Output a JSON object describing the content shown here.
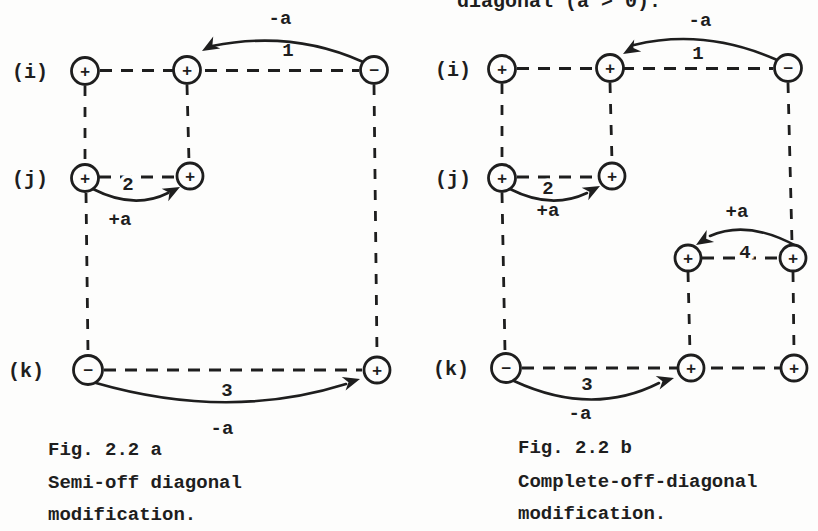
{
  "top_text": "diagonal (a > 0).",
  "colors": {
    "paper": "#fdfdfc",
    "ink": "#1e1e1e"
  },
  "fig_a": {
    "row_i": "(i)",
    "row_j": "(j)",
    "row_k": "(k)",
    "signs": {
      "i1": "+",
      "i2": "+",
      "i3": "−",
      "j1": "+",
      "j2": "+",
      "k1": "−",
      "k2": "+"
    },
    "arc1_num": "1",
    "arc1_amt": "-a",
    "arc2_num": "2",
    "arc2_amt": "+a",
    "arc3_num": "3",
    "arc3_amt": "-a",
    "caption": [
      "Fig. 2.2 a",
      "Semi-off diagonal",
      "modification."
    ]
  },
  "fig_b": {
    "row_i": "(i)",
    "row_j": "(j)",
    "row_k": "(k)",
    "signs": {
      "i1": "+",
      "i2": "+",
      "i3": "−",
      "j1": "+",
      "j2": "+",
      "m1": "+",
      "m2": "+",
      "k1": "−",
      "k2": "+",
      "k3": "+"
    },
    "arc1_num": "1",
    "arc1_amt": "-a",
    "arc2_num": "2",
    "arc2_amt": "+a",
    "arc4_num": "4",
    "arc4_amt": "+a",
    "arc3_num": "3",
    "arc3_amt": "-a",
    "caption": [
      "Fig. 2.2 b",
      "Complete-off-diagonal",
      "modification."
    ]
  }
}
